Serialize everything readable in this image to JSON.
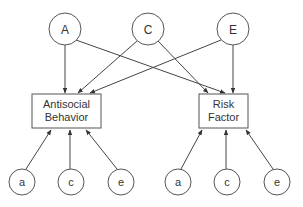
{
  "diagram": {
    "type": "path-diagram",
    "latent_top": [
      {
        "id": "A",
        "label": "A",
        "cx": 65,
        "cy": 29
      },
      {
        "id": "C",
        "label": "C",
        "cx": 148,
        "cy": 29
      },
      {
        "id": "E",
        "label": "E",
        "cx": 233,
        "cy": 29
      }
    ],
    "observed": [
      {
        "id": "antisocial",
        "line1": "Antisocial",
        "line2": "Behavior"
      },
      {
        "id": "risk",
        "line1": "Risk",
        "line2": "Factor"
      }
    ],
    "latent_bottom_left": [
      {
        "id": "a1",
        "label": "a"
      },
      {
        "id": "c1",
        "label": "c"
      },
      {
        "id": "e1",
        "label": "e"
      }
    ],
    "latent_bottom_right": [
      {
        "id": "a2",
        "label": "a"
      },
      {
        "id": "c2",
        "label": "c"
      },
      {
        "id": "e2",
        "label": "e"
      }
    ],
    "edges": [
      {
        "from": "A",
        "to": "antisocial"
      },
      {
        "from": "A",
        "to": "risk"
      },
      {
        "from": "C",
        "to": "antisocial"
      },
      {
        "from": "C",
        "to": "risk"
      },
      {
        "from": "E",
        "to": "antisocial"
      },
      {
        "from": "E",
        "to": "risk"
      },
      {
        "from": "a1",
        "to": "antisocial"
      },
      {
        "from": "c1",
        "to": "antisocial"
      },
      {
        "from": "e1",
        "to": "antisocial"
      },
      {
        "from": "a2",
        "to": "risk"
      },
      {
        "from": "c2",
        "to": "risk"
      },
      {
        "from": "e2",
        "to": "risk"
      }
    ]
  }
}
